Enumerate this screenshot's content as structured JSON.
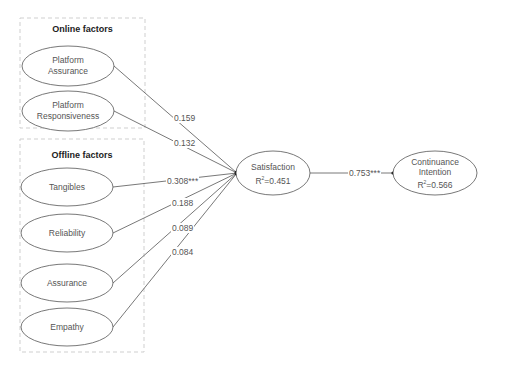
{
  "groups": {
    "online": {
      "title": "Online factors"
    },
    "offline": {
      "title": "Offline factors"
    }
  },
  "constructs": {
    "platform_assurance": {
      "line1": "Platform",
      "line2": "Assurance"
    },
    "platform_responsiveness": {
      "line1": "Platform",
      "line2": "Responsiveness"
    },
    "tangibles": {
      "label": "Tangibles"
    },
    "reliability": {
      "label": "Reliability"
    },
    "assurance": {
      "label": "Assurance"
    },
    "empathy": {
      "label": "Empathy"
    },
    "satisfaction": {
      "label": "Satisfaction",
      "r2_prefix": "R",
      "r2_sup": "2",
      "r2_value": "=0.451"
    },
    "continuance": {
      "line1": "Continuance",
      "line2": "Intention",
      "r2_prefix": "R",
      "r2_sup": "2",
      "r2_value": "=0.566"
    }
  },
  "paths": [
    {
      "from": "Platform Assurance",
      "to": "Satisfaction",
      "coef": "0.159"
    },
    {
      "from": "Platform Responsiveness",
      "to": "Satisfaction",
      "coef": "0.132"
    },
    {
      "from": "Tangibles",
      "to": "Satisfaction",
      "coef": "0.308***"
    },
    {
      "from": "Reliability",
      "to": "Satisfaction",
      "coef": "0.188"
    },
    {
      "from": "Assurance",
      "to": "Satisfaction",
      "coef": "0.089"
    },
    {
      "from": "Empathy",
      "to": "Satisfaction",
      "coef": "0.084"
    },
    {
      "from": "Satisfaction",
      "to": "Continuance Intention",
      "coef": "0.753***"
    }
  ]
}
